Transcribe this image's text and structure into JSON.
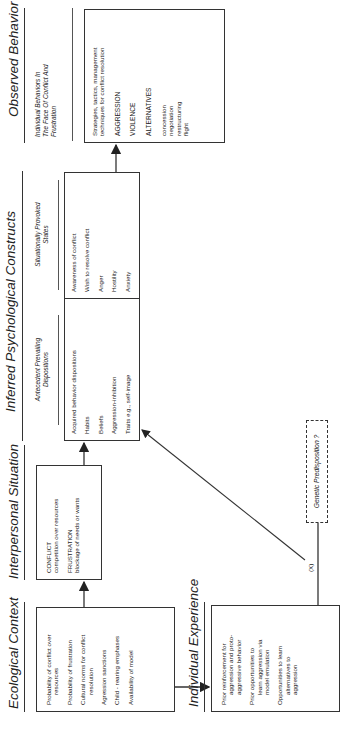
{
  "columns": {
    "ecological": {
      "title": "Ecological Context",
      "items": [
        {
          "line1": "Probability of conflict over",
          "line2": "resources"
        },
        {
          "line1": "Probability of frustration",
          "line2": ""
        },
        {
          "line1": "Cultural norms for conflict",
          "line2": "resolution"
        },
        {
          "line1": "Agression sanctions",
          "line2": ""
        },
        {
          "line1": "Child - rearing emphases",
          "line2": ""
        },
        {
          "line1": "Availability of model",
          "line2": ""
        }
      ]
    },
    "interpersonal": {
      "title": "Interpersonal Situation",
      "items": [
        {
          "head": "CONFLICT",
          "sub": "competition over resources"
        },
        {
          "head": "FRUSTRATION",
          "sub": "blockage of needs or wants"
        }
      ]
    },
    "inferred": {
      "title": "Inferred Psychological Constructs",
      "left_heading": {
        "line1": "Antecedent Prevailing",
        "line2": "Dispositions"
      },
      "right_heading": {
        "line1": "Situationally Provoked",
        "line2": "States"
      },
      "left_items": [
        "Acquired behavior dispositions",
        "Habits",
        "Beliefs",
        "Aggression-inhibition",
        "Traits e.g., self-image"
      ],
      "right_items": [
        "Awareness of conflict",
        "Wish to resolve conflict",
        "Anger",
        "Hostility",
        "Anxiety"
      ]
    },
    "observed": {
      "title": "Observed Behavior",
      "subheading": {
        "line1": "Individual Behaviors In",
        "line2": "The Face Of Conflict And",
        "line3": "Frustration"
      },
      "intro": {
        "line1": "Strategies, tactics, management",
        "line2": "techniques for conflict resolution"
      },
      "categories": [
        "AGGRESSION",
        "VIOLENCE",
        "ALTERNATIVES"
      ],
      "alternatives": [
        "concession",
        "negotiation",
        "restructuring",
        "flight"
      ]
    },
    "individual": {
      "title": "Individual Experience",
      "items": [
        {
          "lines": [
            "Prior reinforcement for",
            "aggression and proto-",
            "aggressive behavior"
          ]
        },
        {
          "lines": [
            "Prior opportunities to",
            "learn aggression via",
            "model emulation"
          ]
        },
        {
          "lines": [
            "Opportunities to learn",
            "alternatives to",
            "aggression"
          ]
        }
      ]
    },
    "genetic": {
      "label": "Genetic Predisposition ?"
    }
  },
  "connector_label": "(X)"
}
